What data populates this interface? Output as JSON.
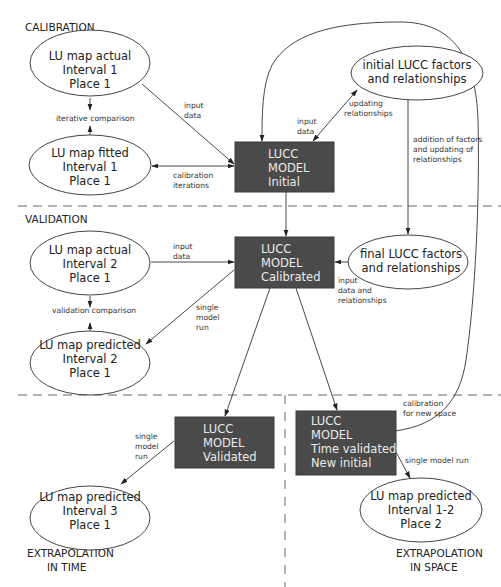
{
  "sections": {
    "calibration": "CALIBRATION",
    "validation": "VALIDATION",
    "extrapolation_time": [
      "EXTRAPOLATION",
      "IN TIME"
    ],
    "extrapolation_space": [
      "EXTRAPOLATION",
      "IN SPACE"
    ]
  },
  "nodes": {
    "lu_actual_1": [
      "LU map actual",
      "Interval 1",
      "Place 1"
    ],
    "lu_fitted_1": [
      "LU map fitted",
      "Interval 1",
      "Place 1"
    ],
    "model_initial": [
      "LUCC",
      "MODEL",
      "Initial"
    ],
    "initial_factors": [
      "initial LUCC factors",
      "and relationships"
    ],
    "lu_actual_2": [
      "LU map actual",
      "Interval 2",
      "Place 1"
    ],
    "model_calibrated": [
      "LUCC",
      "MODEL",
      "Calibrated"
    ],
    "final_factors": [
      "final LUCC factors",
      "and relationships"
    ],
    "lu_predicted_2": [
      "LU map predicted",
      "Interval 2",
      "Place 1"
    ],
    "model_validated": [
      "LUCC",
      "MODEL",
      "Validated"
    ],
    "model_time_validated": [
      "LUCC",
      "MODEL",
      "Time validated",
      "New initial"
    ],
    "lu_predicted_3": [
      "LU map predicted",
      "Interval 3",
      "Place 1"
    ],
    "lu_predicted_12": [
      "LU map predicted",
      "Interval 1-2",
      "Place 2"
    ]
  },
  "edge_labels": {
    "input_data_1": [
      "input",
      "data"
    ],
    "iterative_comparison": [
      "iterative comparison"
    ],
    "calibration_iterations": [
      "calibration",
      "iterations"
    ],
    "input_data_2": [
      "input",
      "data"
    ],
    "updating_relationships": [
      "updating",
      "relationships"
    ],
    "addition_factors": [
      "addition of factors",
      "and updating of",
      "relationships"
    ],
    "input_data_3": [
      "input",
      "data"
    ],
    "validation_comparison": [
      "validation comparison"
    ],
    "single_model_run_1": [
      "single",
      "model",
      "run"
    ],
    "input_data_relationships": [
      "input",
      "data and",
      "relationships"
    ],
    "single_model_run_2": [
      "single",
      "model",
      "run"
    ],
    "calibration_new_space": [
      "calibration",
      "for new space"
    ],
    "single_model_run_3": [
      "single model run"
    ]
  },
  "colors": {
    "box_fill": "#4a4a4a",
    "box_text": "#eaeaea",
    "line": "#333333"
  }
}
